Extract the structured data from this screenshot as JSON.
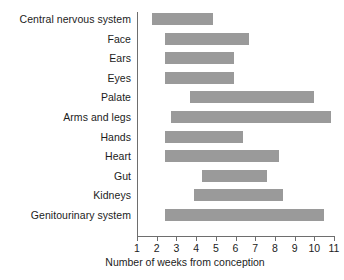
{
  "chart_data": {
    "type": "bar",
    "orientation": "horizontal",
    "subtype": "range-bar",
    "title": "",
    "xlabel": "Number of weeks from conception",
    "ylabel": "",
    "xlim": [
      1,
      11
    ],
    "xticks": [
      1,
      2,
      3,
      4,
      5,
      6,
      7,
      8,
      9,
      10,
      11
    ],
    "xtick_labels": [
      "1",
      "2",
      "3",
      "4",
      "5",
      "6",
      "7",
      "8",
      "9",
      "10",
      "11"
    ],
    "grid": false,
    "legend": null,
    "bar_color": "#9a9a9a",
    "axis_color": "#6e6e6e",
    "categories": [
      "Central nervous system",
      "Face",
      "Ears",
      "Eyes",
      "Palate",
      "Arms and legs",
      "Hands",
      "Heart",
      "Gut",
      "Kidneys",
      "Genitourinary system"
    ],
    "bars": [
      {
        "label": "Central nervous system",
        "start": 1.75,
        "end": 4.85
      },
      {
        "label": "Face",
        "start": 2.4,
        "end": 6.7
      },
      {
        "label": "Ears",
        "start": 2.4,
        "end": 5.9
      },
      {
        "label": "Eyes",
        "start": 2.4,
        "end": 5.9
      },
      {
        "label": "Palate",
        "start": 3.7,
        "end": 10.0
      },
      {
        "label": "Arms and legs",
        "start": 2.75,
        "end": 10.85
      },
      {
        "label": "Hands",
        "start": 2.4,
        "end": 6.4
      },
      {
        "label": "Heart",
        "start": 2.4,
        "end": 8.2
      },
      {
        "label": "Gut",
        "start": 4.3,
        "end": 7.6
      },
      {
        "label": "Kidneys",
        "start": 3.9,
        "end": 8.4
      },
      {
        "label": "Genitourinary system",
        "start": 2.4,
        "end": 10.5
      }
    ]
  }
}
